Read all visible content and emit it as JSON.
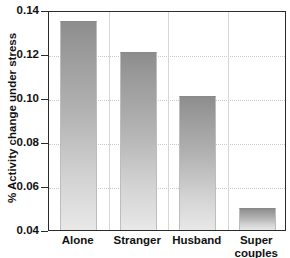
{
  "chart_data": {
    "type": "bar",
    "title": "",
    "xlabel": "",
    "ylabel": "% Activity change under stress",
    "categories": [
      "Alone",
      "Stranger",
      "Husband",
      "Super couples"
    ],
    "category_lines": [
      [
        "Alone"
      ],
      [
        "Stranger"
      ],
      [
        "Husband"
      ],
      [
        "Super",
        "couples"
      ]
    ],
    "values": [
      0.135,
      0.121,
      0.101,
      0.05
    ],
    "ylim": [
      0.04,
      0.14
    ],
    "yticks": [
      0.04,
      0.06,
      0.08,
      0.1,
      0.12,
      0.14
    ],
    "ytick_labels": [
      "0.04",
      "0.06",
      "0.08",
      "0.10",
      "0.12",
      "0.14"
    ],
    "grid": true,
    "grid_axis": "y",
    "legend": "none",
    "bar_color_top": "#8d8d8d",
    "bar_color_bottom": "#e8e8e8",
    "axis_color": "#2b2b2b",
    "grid_color": "#c9c9c9"
  }
}
